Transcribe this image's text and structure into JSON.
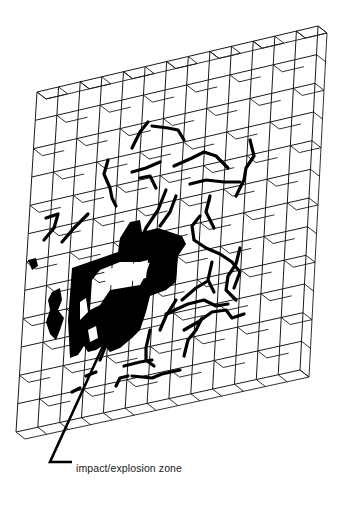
{
  "diagram": {
    "grid": {
      "columns": 13,
      "rows": 12,
      "front_top_left": [
        37,
        92
      ],
      "front_top_right": [
        318,
        26
      ],
      "front_bottom_left": [
        16,
        432
      ],
      "front_bottom_right": [
        300,
        370
      ],
      "depth_offset": [
        9,
        7
      ],
      "line_color": "#1a1a1a"
    },
    "fracture_color": "#000000",
    "callout": {
      "label": "impact/explosion zone",
      "leader_start": [
        108,
        335
      ],
      "leader_elbow": [
        50,
        462
      ],
      "leader_end": [
        72,
        462
      ]
    }
  }
}
